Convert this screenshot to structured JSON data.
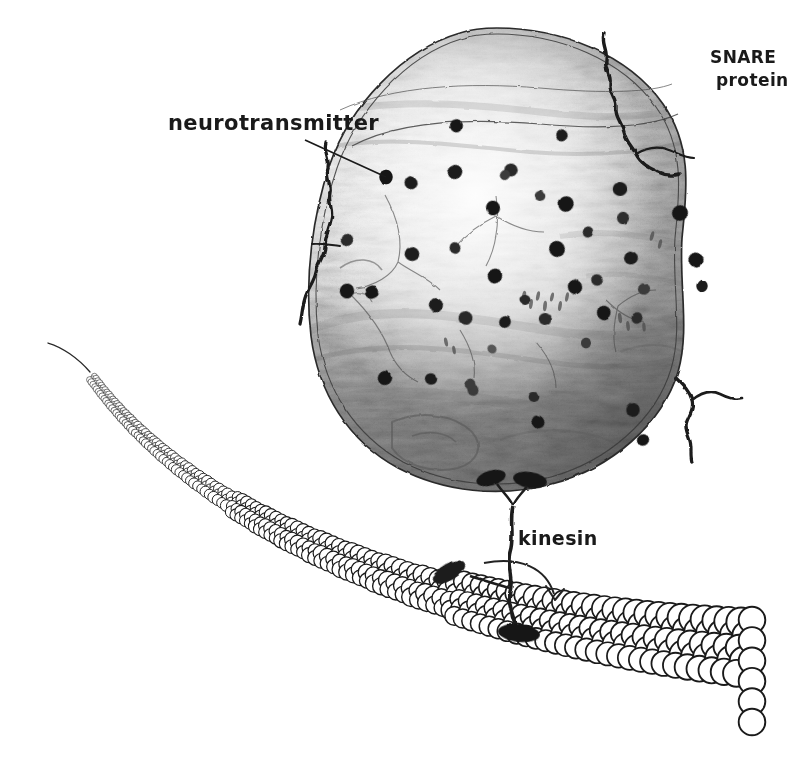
{
  "figure": {
    "background_color": "#ffffff",
    "ink_color": "#1a1a1a",
    "width": 806,
    "height": 759
  },
  "labels": [
    {
      "id": "neurotransmitter",
      "text": "neurotransmitter",
      "x": 168,
      "y": 130,
      "font_size": 21,
      "leader": {
        "from_x": 305,
        "from_y": 140,
        "to_x": 386,
        "to_y": 177
      }
    },
    {
      "id": "snare-line-1",
      "text": "SNARE",
      "x": 710,
      "y": 63,
      "font_size": 17,
      "leader": null
    },
    {
      "id": "snare-line-2",
      "text": "protein",
      "x": 716,
      "y": 86,
      "font_size": 17,
      "leader": null
    },
    {
      "id": "kinesin",
      "text": "kinesin",
      "x": 518,
      "y": 545,
      "font_size": 19,
      "leader": null
    }
  ],
  "vesicle": {
    "name": "synaptic-vesicle",
    "center_x": 497,
    "center_y": 258,
    "radius_x": 186,
    "radius_y": 230,
    "membrane_stroke": "#2b2b2b",
    "membrane_stroke_width": 1.6,
    "membrane_double_line": true,
    "interior_shading": "graphite rubbing, light at upper-centre, dark streaky wood-grain toward lower half and right edge",
    "interior_tone_light": "#f4f4f4",
    "interior_tone_mid": "#b9b9b9",
    "interior_tone_dark": "#6e6e6e"
  },
  "neurotransmitter_dots": {
    "name": "neurotransmitter-vesicle-contents",
    "count": 44,
    "fill": "#161616",
    "diameter_range_px": [
      9,
      17
    ],
    "points": [
      {
        "x": 386,
        "y": 177,
        "r": 8.0,
        "tone": "#161616"
      },
      {
        "x": 455,
        "y": 172,
        "r": 7.4,
        "tone": "#1c1c1c"
      },
      {
        "x": 511,
        "y": 170,
        "r": 6.2,
        "tone": "#2a2a2a"
      },
      {
        "x": 456,
        "y": 126,
        "r": 7.0,
        "tone": "#161616"
      },
      {
        "x": 566,
        "y": 204,
        "r": 7.8,
        "tone": "#161616"
      },
      {
        "x": 620,
        "y": 189,
        "r": 6.6,
        "tone": "#1c1c1c"
      },
      {
        "x": 562,
        "y": 135,
        "r": 6.2,
        "tone": "#1c1c1c"
      },
      {
        "x": 623,
        "y": 218,
        "r": 6.0,
        "tone": "#2e2e2e"
      },
      {
        "x": 680,
        "y": 213,
        "r": 7.2,
        "tone": "#161616"
      },
      {
        "x": 411,
        "y": 183,
        "r": 6.8,
        "tone": "#1c1c1c"
      },
      {
        "x": 493,
        "y": 208,
        "r": 7.0,
        "tone": "#161616"
      },
      {
        "x": 505,
        "y": 175,
        "r": 5.8,
        "tone": "#3a3a3a"
      },
      {
        "x": 540,
        "y": 196,
        "r": 5.4,
        "tone": "#3a3a3a"
      },
      {
        "x": 557,
        "y": 249,
        "r": 7.6,
        "tone": "#161616"
      },
      {
        "x": 588,
        "y": 232,
        "r": 6.0,
        "tone": "#2a2a2a"
      },
      {
        "x": 631,
        "y": 258,
        "r": 6.8,
        "tone": "#1c1c1c"
      },
      {
        "x": 696,
        "y": 260,
        "r": 7.0,
        "tone": "#161616"
      },
      {
        "x": 702,
        "y": 286,
        "r": 6.4,
        "tone": "#1c1c1c"
      },
      {
        "x": 347,
        "y": 240,
        "r": 6.2,
        "tone": "#2a2a2a"
      },
      {
        "x": 412,
        "y": 254,
        "r": 6.6,
        "tone": "#1c1c1c"
      },
      {
        "x": 455,
        "y": 248,
        "r": 6.0,
        "tone": "#2a2a2a"
      },
      {
        "x": 495,
        "y": 276,
        "r": 7.2,
        "tone": "#161616"
      },
      {
        "x": 525,
        "y": 300,
        "r": 6.0,
        "tone": "#2a2a2a"
      },
      {
        "x": 575,
        "y": 287,
        "r": 7.4,
        "tone": "#161616"
      },
      {
        "x": 347,
        "y": 291,
        "r": 7.0,
        "tone": "#161616"
      },
      {
        "x": 372,
        "y": 292,
        "r": 7.6,
        "tone": "#161616"
      },
      {
        "x": 436,
        "y": 305,
        "r": 7.0,
        "tone": "#1c1c1c"
      },
      {
        "x": 466,
        "y": 318,
        "r": 6.2,
        "tone": "#2a2a2a"
      },
      {
        "x": 505,
        "y": 322,
        "r": 6.4,
        "tone": "#1c1c1c"
      },
      {
        "x": 545,
        "y": 319,
        "r": 6.0,
        "tone": "#2a2a2a"
      },
      {
        "x": 604,
        "y": 313,
        "r": 6.6,
        "tone": "#161616"
      },
      {
        "x": 637,
        "y": 318,
        "r": 6.0,
        "tone": "#2a2a2a"
      },
      {
        "x": 644,
        "y": 289,
        "r": 5.8,
        "tone": "#3a3a3a"
      },
      {
        "x": 492,
        "y": 349,
        "r": 5.2,
        "tone": "#555555"
      },
      {
        "x": 586,
        "y": 343,
        "r": 5.4,
        "tone": "#3a3a3a"
      },
      {
        "x": 385,
        "y": 378,
        "r": 6.8,
        "tone": "#161616"
      },
      {
        "x": 431,
        "y": 379,
        "r": 6.6,
        "tone": "#1c1c1c"
      },
      {
        "x": 473,
        "y": 390,
        "r": 5.8,
        "tone": "#3a3a3a"
      },
      {
        "x": 470,
        "y": 384,
        "r": 5.0,
        "tone": "#3a3a3a"
      },
      {
        "x": 534,
        "y": 397,
        "r": 5.6,
        "tone": "#2a2a2a"
      },
      {
        "x": 538,
        "y": 422,
        "r": 6.4,
        "tone": "#161616"
      },
      {
        "x": 633,
        "y": 410,
        "r": 6.2,
        "tone": "#1c1c1c"
      },
      {
        "x": 643,
        "y": 440,
        "r": 6.4,
        "tone": "#161616"
      },
      {
        "x": 597,
        "y": 280,
        "r": 5.6,
        "tone": "#2a2a2a"
      }
    ]
  },
  "snare_proteins": {
    "name": "snare-protein-group",
    "count": 3,
    "stroke": "#1a1a1a",
    "description": "squiggly coiled filaments projecting outward through the vesicle membrane",
    "items": [
      {
        "id": "snare-top-right",
        "anchor_x": 614,
        "anchor_y": 95,
        "tip_x": 604,
        "tip_y": 34
      },
      {
        "id": "snare-left",
        "anchor_x": 327,
        "anchor_y": 245,
        "tip_x": 300,
        "tip_y": 322
      },
      {
        "id": "snare-bottom-right",
        "anchor_x": 688,
        "anchor_y": 388,
        "tip_x": 712,
        "tip_y": 452
      }
    ]
  },
  "kinesin": {
    "name": "kinesin-motor-protein",
    "stroke": "#1a1a1a",
    "cargo_attachment_points": [
      {
        "x": 490,
        "y": 478
      },
      {
        "x": 527,
        "y": 478
      }
    ],
    "stalk": {
      "top_x": 512,
      "top_y": 492,
      "bottom_x": 516,
      "bottom_y": 628
    },
    "foot_lifted": {
      "x": 444,
      "y": 575,
      "angle_deg": -28
    },
    "foot_bound": {
      "x": 517,
      "y": 632
    },
    "motion_arrow": {
      "from_x": 485,
      "from_y": 563,
      "ctrl_x": 545,
      "ctrl_y": 566,
      "to_x": 556,
      "to_y": 598,
      "head_size": 11
    }
  },
  "microtubule": {
    "name": "microtubule-filament",
    "subunit_name": "tubulin-dimer",
    "stroke": "#1a1a1a",
    "fill": "#ffffff",
    "description": "chain of open circles receding into the distance at upper-left, foreground rows at lower-right",
    "thin_tail_start": {
      "x": 48,
      "y": 343
    },
    "bead_start": {
      "x": 96,
      "y": 383
    },
    "bead_end": {
      "x": 760,
      "y": 660
    },
    "bead_radius_near": 14,
    "bead_radius_far": 3.2,
    "row_count_near": 5,
    "terminal_column": {
      "x": 730,
      "y_top": 620,
      "y_bottom": 722,
      "count": 6
    }
  },
  "chart_data": {
    "type": "diagram",
    "elements": [
      {
        "label": "neurotransmitter",
        "role": "vesicle cargo molecules (dark dots inside vesicle)"
      },
      {
        "label": "SNARE protein",
        "role": "membrane fusion filaments on vesicle surface"
      },
      {
        "label": "kinesin",
        "role": "motor protein walking along microtubule"
      },
      {
        "label": "microtubule",
        "role": "cytoskeletal track made of tubulin subunits"
      }
    ],
    "annotations": [
      "neurotransmitter",
      "SNARE protein",
      "kinesin"
    ],
    "legend": "none",
    "grid": false
  }
}
